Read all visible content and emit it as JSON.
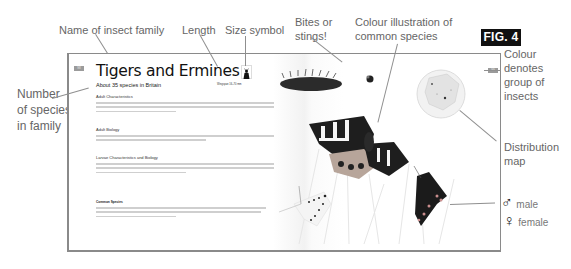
{
  "figure": {
    "badge": "FIG. 4"
  },
  "callouts": {
    "family_name": "Name of insect family",
    "length": "Length",
    "size_symbol": "Size symbol",
    "bites": [
      "Bites or",
      "stings!"
    ],
    "colour_illustration": [
      "Colour illustration of",
      "common species"
    ],
    "colour_group": [
      "Colour",
      "denotes",
      "group of",
      "insects"
    ],
    "species_count": [
      "Number",
      "of species",
      "in family"
    ],
    "distribution": [
      "Distribution",
      "map"
    ],
    "male": "male",
    "female": "female",
    "male_symbol": "♂",
    "female_symbol": "♀"
  },
  "page": {
    "left_tab": "98",
    "right_tab": "99",
    "title": "Tigers and Ermines",
    "subtitle": "About 35 species in Britain",
    "wingspan": "Wingspan 16–70 mm",
    "sections": [
      {
        "heading": "Adult Characteristics",
        "lines": 3
      },
      {
        "heading": "Adult Biology",
        "lines": 2
      },
      {
        "heading": "Larvae Characteristics and Biology",
        "lines": 3
      }
    ],
    "common_species_heading": "Common Species",
    "common_species_lines": 3
  },
  "colors": {
    "badge_bg": "#111111",
    "group_tab": "#9b9b9b",
    "leader_line": "#8f8f8f"
  }
}
